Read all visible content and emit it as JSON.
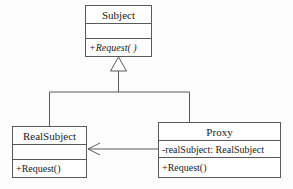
{
  "diagram": {
    "type": "uml-class-diagram",
    "background_color": "#fdfdfd",
    "line_color": "#5a5a5a",
    "text_color": "#1a1a1a",
    "classes": [
      {
        "id": "subject",
        "name": "Subject",
        "attributes": [
          ""
        ],
        "operations": [
          "+Request( )"
        ],
        "operation_style": "italic",
        "abstract": true
      },
      {
        "id": "realsubject",
        "name": "RealSubject",
        "attributes": [
          ""
        ],
        "operations": [
          "+Request()"
        ],
        "operation_style": "normal",
        "abstract": false
      },
      {
        "id": "proxy",
        "name": "Proxy",
        "attributes": [
          "-realSubject: RealSubject"
        ],
        "operations": [
          "+Request()"
        ],
        "operation_style": "normal",
        "abstract": false
      }
    ],
    "relationships": [
      {
        "id": "generalization-realsubject-subject",
        "kind": "generalization",
        "from": "RealSubject",
        "to": "Subject",
        "arrow": "hollow-triangle"
      },
      {
        "id": "generalization-proxy-subject",
        "kind": "generalization",
        "from": "Proxy",
        "to": "Subject",
        "arrow": "hollow-triangle"
      },
      {
        "id": "association-proxy-realsubject",
        "kind": "association",
        "from": "Proxy",
        "to": "RealSubject",
        "arrow": "open-arrowhead"
      }
    ]
  }
}
